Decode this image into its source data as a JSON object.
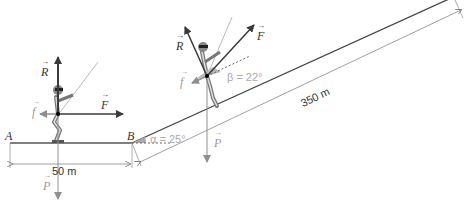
{
  "diagram": {
    "points": {
      "A": "A",
      "B": "B"
    },
    "distances": {
      "flat": "50 m",
      "slope": "350 m"
    },
    "angles": {
      "alpha": "α = 25°",
      "beta": "β = 22°"
    },
    "forces": {
      "skier_flat": {
        "R": "R",
        "F": "F",
        "f": "f",
        "P": "P"
      },
      "skier_slope": {
        "R": "R",
        "F": "F",
        "f": "f",
        "P": "P"
      }
    },
    "colors": {
      "line": "#444444",
      "vector_dark": "#3a3a3a",
      "vector_gray": "#9a9a9a",
      "dim": "#8a8a8a"
    }
  }
}
